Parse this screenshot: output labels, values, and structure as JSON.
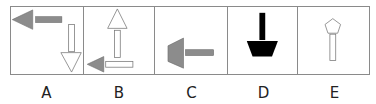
{
  "options": [
    {
      "label": "A",
      "figure": "gray-left-arrow-top-and-white-down-arrow-right"
    },
    {
      "label": "B",
      "figure": "white-up-arrow-and-gray-left-arrow-bottom"
    },
    {
      "label": "C",
      "figure": "gray-trapezoid-with-horizontal-bar"
    },
    {
      "label": "D",
      "figure": "black-trapezoid-with-vertical-bar"
    },
    {
      "label": "E",
      "figure": "white-pentagon-with-vertical-bar"
    }
  ],
  "colors": {
    "gray": "#8c8c8c",
    "black": "#000000",
    "outline": "#7a7a7a",
    "white": "#ffffff"
  }
}
